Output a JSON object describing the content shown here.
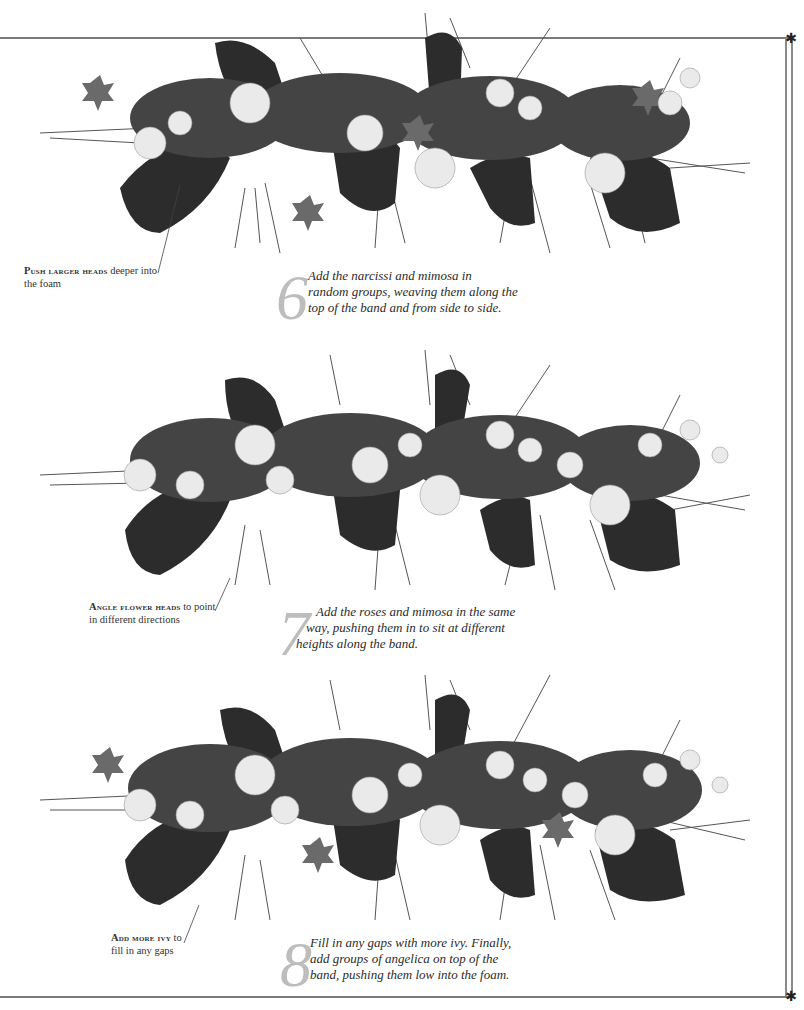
{
  "page": {
    "background": "#ffffff",
    "border_color": "#7a7a7a",
    "ornament": "✱"
  },
  "photos": [
    {
      "id": "arrangement-step-6",
      "alt": "Long mossy band arrangement with bark, ivy, mimosa and narcissi"
    },
    {
      "id": "arrangement-step-7",
      "alt": "Band arrangement with roses and mimosa added"
    },
    {
      "id": "arrangement-step-8",
      "alt": "Finished band arrangement with extra ivy and angelica"
    }
  ],
  "callouts": [
    {
      "lead": "Push larger heads",
      "rest_line1": " deeper into",
      "line2": "the foam"
    },
    {
      "lead": "Angle flower heads",
      "rest_line1": " to point",
      "line2": "in different directions"
    },
    {
      "lead": "Add more ivy",
      "rest_line1": " to",
      "line2": "fill in any gaps"
    }
  ],
  "steps": [
    {
      "number": "6",
      "lines": [
        "Add the narcissi and mimosa in",
        "random groups, weaving them along the",
        "top of the band and from side to side."
      ]
    },
    {
      "number": "7",
      "lines": [
        "Add the roses and mimosa in the same",
        "way, pushing them in to sit at different",
        "heights along the band."
      ]
    },
    {
      "number": "8",
      "lines": [
        "Fill in any gaps with more ivy. Finally,",
        "add groups of angelica on top of the",
        "band, pushing them low into the foam."
      ]
    }
  ]
}
